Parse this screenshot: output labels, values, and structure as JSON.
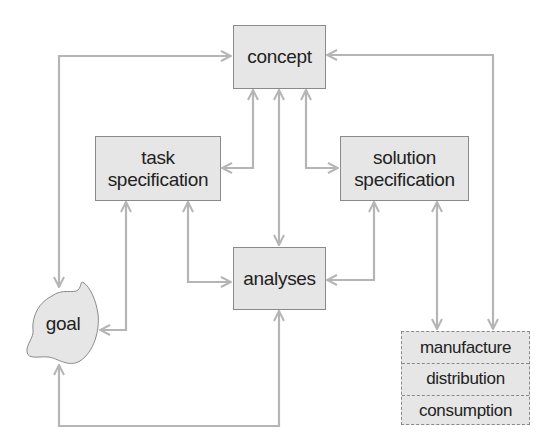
{
  "diagram": {
    "title": "",
    "nodes": {
      "concept": {
        "label": "concept"
      },
      "task_spec": {
        "line1": "task",
        "line2": "specification"
      },
      "solution_spec": {
        "line1": "solution",
        "line2": "specification"
      },
      "analyses": {
        "label": "analyses"
      },
      "goal": {
        "label": "goal"
      },
      "lifecycle": {
        "rows": [
          "manufacture",
          "distribution",
          "consumption"
        ]
      }
    },
    "edges": [
      {
        "from": "concept",
        "to": "goal",
        "type": "bidirectional"
      },
      {
        "from": "concept",
        "to": "task_spec",
        "type": "bidirectional"
      },
      {
        "from": "concept",
        "to": "analyses",
        "type": "bidirectional"
      },
      {
        "from": "concept",
        "to": "solution_spec",
        "type": "bidirectional"
      },
      {
        "from": "concept",
        "to": "lifecycle",
        "type": "bidirectional"
      },
      {
        "from": "task_spec",
        "to": "goal",
        "type": "bidirectional"
      },
      {
        "from": "task_spec",
        "to": "analyses",
        "type": "bidirectional"
      },
      {
        "from": "solution_spec",
        "to": "analyses",
        "type": "bidirectional"
      },
      {
        "from": "solution_spec",
        "to": "lifecycle",
        "type": "bidirectional"
      },
      {
        "from": "analyses",
        "to": "goal",
        "type": "bidirectional"
      }
    ],
    "colors": {
      "line": "#b5b5b5",
      "box_fill": "#e6e6e6",
      "box_border": "#8a8a8a"
    }
  }
}
